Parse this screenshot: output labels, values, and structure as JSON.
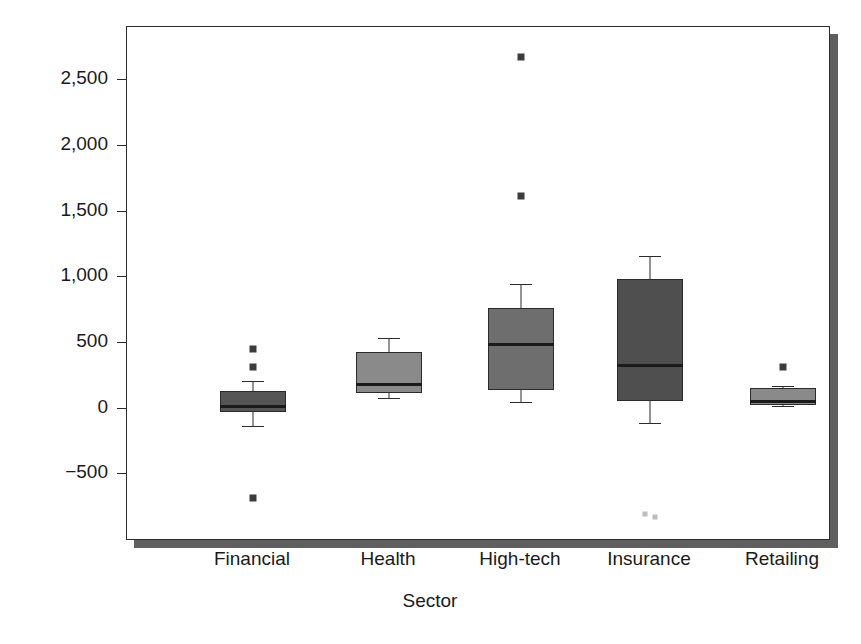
{
  "chart_data": {
    "type": "box",
    "title": "",
    "xlabel": "Sector",
    "ylabel": "Net profits ($, millions)",
    "categories": [
      "Financial",
      "Health",
      "High-tech",
      "Insurance",
      "Retailing"
    ],
    "ylim": [
      -850,
      2800
    ],
    "yticks": [
      -500,
      0,
      500,
      1000,
      1500,
      2000,
      2500
    ],
    "ytick_labels": [
      "-500",
      "0",
      "500",
      "1,000",
      "1,500",
      "2,000",
      "2,500"
    ],
    "grid": false,
    "legend": "none",
    "box_fill_colors": [
      "#555555",
      "#8a8a8a",
      "#6e6e6e",
      "#4f4f4f",
      "#8a8a8a"
    ],
    "boxes": [
      {
        "category": "Financial",
        "whisker_low": -140,
        "q1": -35,
        "median": 20,
        "q3": 130,
        "whisker_high": 205,
        "outliers": [
          445,
          310,
          -685
        ]
      },
      {
        "category": "Health",
        "whisker_low": 75,
        "q1": 110,
        "median": 185,
        "q3": 425,
        "whisker_high": 530,
        "outliers": []
      },
      {
        "category": "High-tech",
        "whisker_low": 45,
        "q1": 135,
        "median": 495,
        "q3": 755,
        "whisker_high": 945,
        "outliers": [
          2670,
          1610
        ]
      },
      {
        "category": "Insurance",
        "whisker_low": -120,
        "q1": 50,
        "median": 335,
        "q3": 980,
        "whisker_high": 1155,
        "outliers": [
          -810,
          -830
        ]
      },
      {
        "category": "Retailing",
        "whisker_low": 10,
        "q1": 20,
        "median": 60,
        "q3": 150,
        "whisker_high": 165,
        "outliers": [
          310
        ]
      }
    ]
  },
  "axis_colors": {
    "frame": "#2b2b2b",
    "shadow": "#5f5f5f",
    "text": "#1a1a1a",
    "outlier": "#3c3c3c"
  }
}
